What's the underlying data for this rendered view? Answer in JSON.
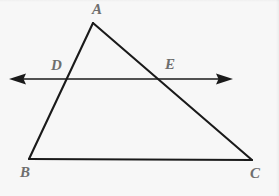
{
  "figure": {
    "type": "euclidean-geometry-diagram",
    "background_color": "#f7f7f7",
    "stroke_color": "#1a1a1a",
    "label_color": "#6e6e6e",
    "canvas": {
      "width": 279,
      "height": 196
    }
  },
  "points": {
    "A": {
      "label": "A",
      "x": 93,
      "y": 23,
      "label_x": 92,
      "label_y": 2
    },
    "B": {
      "label": "B",
      "x": 29,
      "y": 159,
      "label_x": 20,
      "label_y": 165
    },
    "C": {
      "label": "C",
      "x": 252,
      "y": 160,
      "label_x": 250,
      "label_y": 166
    },
    "D": {
      "label": "D",
      "x": 65,
      "y": 79,
      "label_x": 51,
      "label_y": 58
    },
    "E": {
      "label": "E",
      "x": 161,
      "y": 79,
      "label_x": 165,
      "label_y": 57
    }
  },
  "segments": [
    {
      "name": "side-AB",
      "from": "A",
      "to": "B",
      "x1": 93,
      "y1": 23,
      "x2": 29,
      "y2": 159,
      "width": 2.1
    },
    {
      "name": "side-AC",
      "from": "A",
      "to": "C",
      "x1": 93,
      "y1": 23,
      "x2": 252,
      "y2": 160,
      "width": 2.1
    },
    {
      "name": "side-BC",
      "from": "B",
      "to": "C",
      "x1": 29,
      "y1": 159,
      "x2": 252,
      "y2": 160,
      "width": 2.1
    }
  ],
  "transversal": {
    "name": "line-DE",
    "through": [
      "D",
      "E"
    ],
    "y": 79,
    "x_start": 9,
    "x_end": 233,
    "width": 1.7,
    "arrowheads": "both",
    "left_arrow": {
      "tip_x": 9,
      "tip_y": 79,
      "base_x": 26,
      "half_height": 5.5
    },
    "right_arrow": {
      "tip_x": 233,
      "tip_y": 79,
      "base_x": 216,
      "half_height": 5.5
    }
  }
}
